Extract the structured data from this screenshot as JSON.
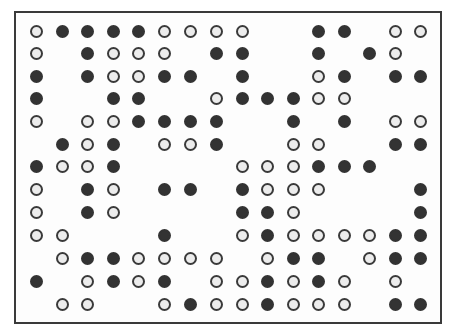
{
  "grid": {
    "columns": 16,
    "rows": 13,
    "legend": {
      "X": "filled-circle",
      "O": "open-circle",
      ".": "empty"
    },
    "colors": {
      "filled": "#333333",
      "open_fill": "#ececec",
      "outline": "#3a3a3a",
      "frame": "#3a3a3a"
    },
    "col_x": [
      36,
      62,
      87,
      113,
      138,
      164,
      190,
      216,
      242,
      267,
      293,
      318,
      344,
      369,
      395,
      420
    ],
    "row_y": [
      31,
      53,
      76,
      98,
      121,
      144,
      166,
      189,
      212,
      235,
      258,
      281,
      304
    ],
    "pattern": [
      "OXXXXOOOO..XX.OO",
      "O.XOOO.XX..X.XO.",
      "X.XOOXX.X..OX.XX",
      "X..XX..OXXXOO...",
      "O.OOXXXX..X.X.OO",
      ".XOX.OOX..OO..XX",
      "XOOX....OOOXXX..",
      "O.XO.XX.XOOO...X",
      "O.XO....XXO....X",
      "OO...X..OXOOOOXX",
      ".OXXOOOO.OXX.OXX",
      "X.OXOX.OOXOXO.O.",
      ".OO..OXOOXOOO.XX"
    ]
  }
}
